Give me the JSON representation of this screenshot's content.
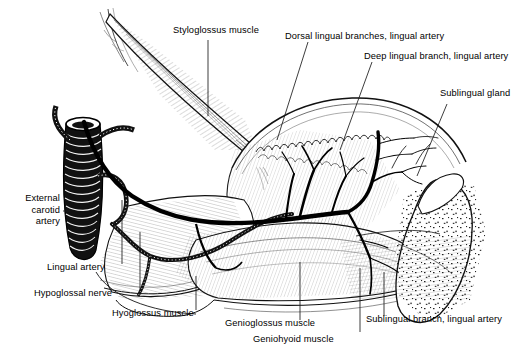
{
  "figure": {
    "background_color": "#ffffff",
    "ink_color": "#000000",
    "width": 532,
    "height": 348
  },
  "labels": {
    "styloglossus": "Styloglossus muscle",
    "dorsal_lingual": "Dorsal lingual branches, lingual artery",
    "deep_lingual": "Deep lingual branch, lingual artery",
    "sublingual_gland": "Sublingual gland",
    "external_carotid_l1": "External",
    "external_carotid_l2": "carotid",
    "external_carotid_l3": "artery",
    "lingual_artery": "Lingual artery",
    "hypoglossal_nerve": "Hypoglossal nerve",
    "hyoglossus": "Hyoglossus muscle",
    "genioglossus": "Genioglossus muscle",
    "geniohyoid": "Geniohyoid muscle",
    "sublingual_branch": "Sublingual branch, lingual artery"
  }
}
